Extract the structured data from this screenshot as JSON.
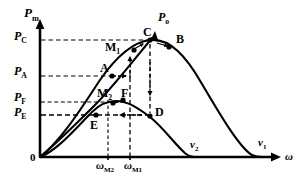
{
  "figure": {
    "kind": "line-plot-diagram",
    "background": "#ffffff",
    "ink": "#000000"
  },
  "axes": {
    "y_label_main": "P",
    "y_label_sub": "m",
    "x_label_main": "ω",
    "x_label_sub": "",
    "origin_label": "0",
    "y_ticks": [
      {
        "main": "P",
        "sub": "C",
        "value": 0.86
      },
      {
        "main": "P",
        "sub": "A",
        "value": 0.62
      },
      {
        "main": "P",
        "sub": "F",
        "value": 0.44
      },
      {
        "main": "P",
        "sub": "E",
        "value": 0.3
      }
    ],
    "x_ticks": [
      {
        "main": "ω",
        "sub": "M2",
        "value": 0.36
      },
      {
        "main": "ω",
        "sub": "M1",
        "value": 0.47
      }
    ]
  },
  "curves": [
    {
      "name": "v1",
      "label_main": "v",
      "label_sub": "1",
      "description": "upper power curve for higher wind speed v1",
      "peak": {
        "x": 0.47,
        "y": 0.86
      },
      "end_x": 0.96
    },
    {
      "name": "v2",
      "label_main": "v",
      "label_sub": "2",
      "description": "lower power curve for lower wind speed v2",
      "peak": {
        "x": 0.36,
        "y": 0.44
      },
      "end_x": 0.69
    },
    {
      "name": "Po",
      "label_main": "P",
      "label_sub": "o",
      "description": "optimal power tracking locus through E, M2, A, M1, C",
      "style": "solid-with-arrow-head"
    }
  ],
  "points": [
    {
      "id": "C",
      "main": "C",
      "sub": "",
      "x": 0.47,
      "y": 0.86
    },
    {
      "id": "B",
      "main": "B",
      "sub": "",
      "x": 0.58,
      "y": 0.83
    },
    {
      "id": "M1",
      "main": "M",
      "sub": "1",
      "x": 0.41,
      "y": 0.8
    },
    {
      "id": "A",
      "main": "A",
      "sub": "",
      "x": 0.34,
      "y": 0.62
    },
    {
      "id": "F",
      "main": "F",
      "sub": "",
      "x": 0.36,
      "y": 0.44
    },
    {
      "id": "M2",
      "main": "M",
      "sub": "2",
      "x": 0.32,
      "y": 0.42
    },
    {
      "id": "D",
      "main": "D",
      "sub": "",
      "x": 0.47,
      "y": 0.3
    },
    {
      "id": "E",
      "main": "E",
      "sub": "",
      "x": 0.26,
      "y": 0.3
    }
  ],
  "guides": {
    "dashed_horizontal": [
      "PC to C",
      "PA to A",
      "PF to F",
      "PE to D"
    ],
    "dashed_vertical": [
      "wM2 to M2/F",
      "wM1 to M1 and C to D"
    ],
    "arrows": [
      {
        "from": "A",
        "to": "right",
        "orientation": "horizontal"
      },
      {
        "from": "wM1 line",
        "to": "up toward M1",
        "orientation": "vertical"
      },
      {
        "from": "C",
        "to": "down toward D",
        "orientation": "vertical"
      },
      {
        "from": "D",
        "to": "left toward E",
        "orientation": "horizontal"
      }
    ]
  }
}
